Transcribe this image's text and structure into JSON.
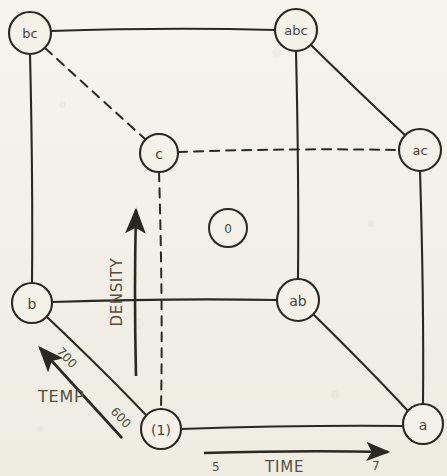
{
  "diagram": {
    "type": "factorial-design-cube",
    "title_text": "",
    "nodes": [
      {
        "id": "bc",
        "label": "bc",
        "x": 30,
        "y": 33,
        "r": 21
      },
      {
        "id": "abc",
        "label": "abc",
        "x": 296,
        "y": 30,
        "r": 21
      },
      {
        "id": "ac",
        "label": "ac",
        "x": 420,
        "y": 150,
        "r": 21
      },
      {
        "id": "c",
        "label": "c",
        "x": 159,
        "y": 153,
        "r": 19
      },
      {
        "id": "0",
        "label": "0",
        "x": 228,
        "y": 228,
        "r": 19
      },
      {
        "id": "b",
        "label": "b",
        "x": 32,
        "y": 303,
        "r": 20
      },
      {
        "id": "ab",
        "label": "ab",
        "x": 298,
        "y": 300,
        "r": 21
      },
      {
        "id": "one",
        "label": "(1)",
        "x": 161,
        "y": 429,
        "r": 20
      },
      {
        "id": "a",
        "label": "a",
        "x": 423,
        "y": 424,
        "r": 20
      }
    ],
    "edges": [
      {
        "from": "bc",
        "to": "abc",
        "style": "solid"
      },
      {
        "from": "bc",
        "to": "b",
        "style": "solid"
      },
      {
        "from": "bc",
        "to": "c",
        "style": "dashed"
      },
      {
        "from": "abc",
        "to": "ac",
        "style": "solid"
      },
      {
        "from": "abc",
        "to": "ab",
        "style": "solid"
      },
      {
        "from": "c",
        "to": "ac",
        "style": "dashed"
      },
      {
        "from": "c",
        "to": "one",
        "style": "dashed"
      },
      {
        "from": "ac",
        "to": "a",
        "style": "solid"
      },
      {
        "from": "b",
        "to": "ab",
        "style": "solid"
      },
      {
        "from": "b",
        "to": "one",
        "style": "solid"
      },
      {
        "from": "ab",
        "to": "a",
        "style": "solid"
      },
      {
        "from": "one",
        "to": "a",
        "style": "solid"
      }
    ],
    "axes": {
      "density": {
        "label": "DENSITY",
        "orientation": "vertical",
        "arrow_from": {
          "x": 136,
          "y": 376
        },
        "arrow_to": {
          "x": 136,
          "y": 206
        }
      },
      "temp": {
        "label": "TEMP",
        "orientation": "diagonal",
        "arrow_from": {
          "x": 122,
          "y": 438
        },
        "arrow_to": {
          "x": 36,
          "y": 344
        },
        "low_value": "600",
        "high_value": "700"
      },
      "time": {
        "label": "TIME",
        "orientation": "horizontal",
        "arrow_from": {
          "x": 204,
          "y": 453
        },
        "arrow_to": {
          "x": 393,
          "y": 453
        },
        "low_value": "5",
        "high_value": "7"
      }
    },
    "colors": {
      "ink": "#2b2822",
      "label_ink": "#4a463c",
      "paper": "#f3f1e8"
    }
  }
}
